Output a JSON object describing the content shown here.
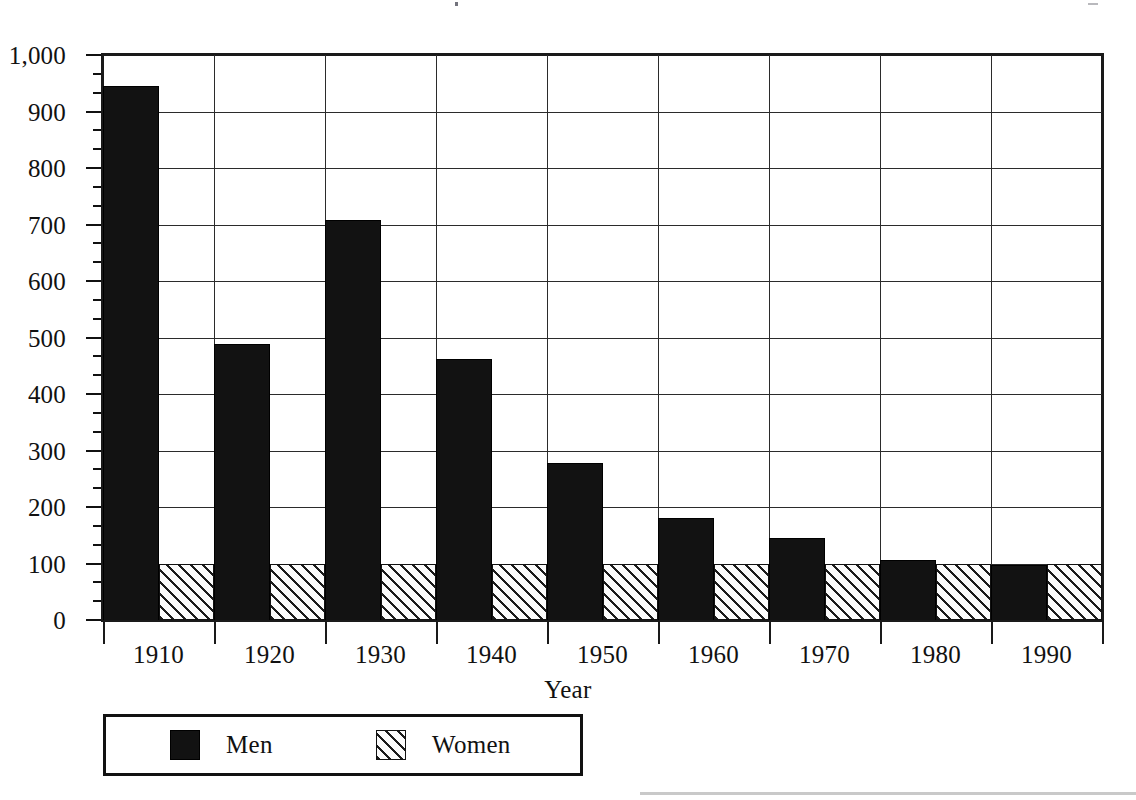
{
  "chart_data": {
    "type": "bar",
    "title": "",
    "subtitle": "",
    "xlabel": "Year",
    "ylabel": "",
    "categories": [
      "1910",
      "1920",
      "1930",
      "1940",
      "1950",
      "1960",
      "1970",
      "1980",
      "1990"
    ],
    "series": [
      {
        "name": "Men",
        "pattern": "solid-black",
        "color": "#121212",
        "values": [
          945,
          489,
          708,
          462,
          278,
          181,
          146,
          106,
          97
        ]
      },
      {
        "name": "Women",
        "pattern": "diagonal-hatch",
        "color": "#1b1b1b",
        "values": [
          100,
          100,
          100,
          100,
          100,
          100,
          100,
          100,
          100
        ]
      }
    ],
    "ylim": [
      0,
      1000
    ],
    "yticks": [
      0,
      100,
      200,
      300,
      400,
      500,
      600,
      700,
      800,
      900,
      1000
    ],
    "ytick_labels": [
      "0",
      "100",
      "200",
      "300",
      "400",
      "500",
      "600",
      "700",
      "800",
      "900",
      "1,000"
    ],
    "minor_ticks_per_interval": 2,
    "grid": "horizontal-and-vertical",
    "legend_position": "below-axis-left",
    "legend_entries": [
      "Men",
      "Women"
    ]
  },
  "axes": {
    "x_title": "Year",
    "y_tick_labels": [
      "1,000",
      "900",
      "800",
      "700",
      "600",
      "500",
      "400",
      "300",
      "200",
      "100",
      "0"
    ],
    "x_tick_labels": [
      "1910",
      "1920",
      "1930",
      "1940",
      "1950",
      "1960",
      "1970",
      "1980",
      "1990"
    ]
  },
  "legend": {
    "items": [
      {
        "label": "Men",
        "swatch": "solid-black-swatch"
      },
      {
        "label": "Women",
        "swatch": "diagonal-hatch-swatch"
      }
    ]
  }
}
